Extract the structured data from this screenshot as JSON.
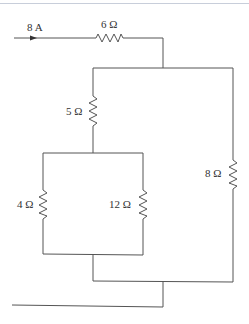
{
  "diagram": {
    "type": "circuit",
    "source": {
      "label": "8 A",
      "direction": "right"
    },
    "resistors": [
      {
        "id": "r6",
        "label": "6 Ω",
        "value_ohms": 6,
        "orientation": "horizontal",
        "position": "series-input"
      },
      {
        "id": "r5",
        "label": "5 Ω",
        "value_ohms": 5,
        "orientation": "vertical",
        "position": "left-branch-top"
      },
      {
        "id": "r4",
        "label": "4 Ω",
        "value_ohms": 4,
        "orientation": "vertical",
        "position": "inner-left"
      },
      {
        "id": "r12",
        "label": "12 Ω",
        "value_ohms": 12,
        "orientation": "vertical",
        "position": "inner-right"
      },
      {
        "id": "r8",
        "label": "8 Ω",
        "value_ohms": 8,
        "orientation": "vertical",
        "position": "right-branch"
      }
    ],
    "colors": {
      "wire": "#555555",
      "label": "#333333",
      "top_rule": "#c8ceda"
    }
  }
}
